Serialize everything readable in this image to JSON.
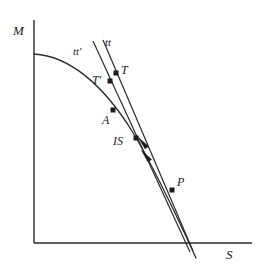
{
  "figure": {
    "type": "economics-diagram",
    "background_color": "#ffffff",
    "line_color": "#1a1a1a"
  },
  "axes": {
    "y_label": "M",
    "x_label": "S",
    "origin_px": [
      34,
      243
    ],
    "y_axis_top_px": [
      34,
      20
    ],
    "x_axis_right_px": [
      252,
      243
    ],
    "y_label_pos_px": [
      13,
      24
    ],
    "x_label_pos_px": [
      226,
      249
    ]
  },
  "curve": {
    "name": "frontier-curve",
    "start_px": [
      34,
      54
    ],
    "end_px": [
      196,
      258
    ],
    "shape": "concave-decreasing"
  },
  "lines": [
    {
      "name": "tt",
      "label": "tt",
      "label_pos_px": [
        105,
        38
      ],
      "start_px": [
        103,
        40
      ],
      "end_px": [
        193,
        251
      ]
    },
    {
      "name": "tt-prime",
      "label": "tt'",
      "label_pos_px": [
        73,
        47
      ],
      "start_px": [
        93,
        41
      ],
      "end_px": [
        190,
        252
      ]
    }
  ],
  "points": [
    {
      "name": "T",
      "label": "T",
      "dot_px": [
        116,
        73
      ],
      "label_pos_px": [
        121,
        65
      ]
    },
    {
      "name": "T'",
      "label": "T'",
      "dot_px": [
        110,
        81
      ],
      "label_pos_px": [
        93,
        76
      ]
    },
    {
      "name": "A",
      "label": "A",
      "dot_px": [
        113,
        110
      ],
      "label_pos_px": [
        103,
        115
      ]
    },
    {
      "name": "IS",
      "label": "IS",
      "dot_px": [
        136,
        138
      ],
      "label_pos_px": [
        114,
        136
      ]
    },
    {
      "name": "P",
      "label": "P",
      "dot_px": [
        172,
        190
      ],
      "label_pos_px": [
        177,
        177
      ]
    }
  ],
  "arrows": [
    {
      "name": "arrow-upper",
      "tip_px": [
        139,
        138
      ],
      "tail_px": [
        150,
        151
      ]
    },
    {
      "name": "arrow-lower",
      "tip_px": [
        142,
        151
      ],
      "tail_px": [
        153,
        164
      ]
    }
  ]
}
